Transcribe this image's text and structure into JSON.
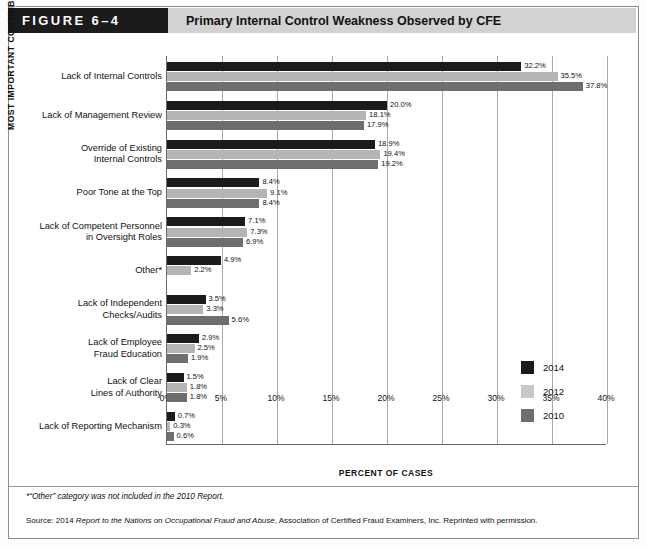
{
  "header": {
    "figure_tag": "FIGURE 6–4",
    "title": "Primary Internal Control Weakness Observed by CFE"
  },
  "axes": {
    "y_axis_title": "MOST IMPORTANT CONTRIBUTING FACTOR",
    "x_axis_title": "PERCENT OF CASES"
  },
  "legend": {
    "items": [
      {
        "label": "2014",
        "color": "#1b1b1b"
      },
      {
        "label": "2012",
        "color": "#c8c8c8"
      },
      {
        "label": "2010",
        "color": "#6e6e6e"
      }
    ]
  },
  "notes": {
    "footnote": "*“Other” category was not included in the 2010 Report.",
    "source_prefix": "Source: 2014 ",
    "source_italic1": "Report to the Nations",
    "source_mid": " on ",
    "source_italic2": "Occupational Fraud and Abuse",
    "source_suffix": ", Association of Certified Fraud Examiners, Inc. Reprinted with permission."
  },
  "chart_data": {
    "type": "bar",
    "orientation": "horizontal",
    "title": "Primary Internal Control Weakness Observed by CFE",
    "xlabel": "PERCENT OF CASES",
    "ylabel": "MOST IMPORTANT CONTRIBUTING FACTOR",
    "xlim": [
      0,
      40
    ],
    "xticks": [
      "0%",
      "5%",
      "10%",
      "15%",
      "20%",
      "25%",
      "30%",
      "35%",
      "40%"
    ],
    "xtick_values": [
      0,
      5,
      10,
      15,
      20,
      25,
      30,
      35,
      40
    ],
    "grid": true,
    "legend_position": "right-inside",
    "categories": [
      "Lack of Internal Controls",
      "Lack of Management Review",
      "Override of Existing\nInternal Controls",
      "Poor Tone at the Top",
      "Lack of Competent Personnel\nin Oversight Roles",
      "Other*",
      "Lack of Independent\nChecks/Audits",
      "Lack of Employee\nFraud Education",
      "Lack of Clear\nLines of Authority",
      "Lack of Reporting Mechanism"
    ],
    "series": [
      {
        "name": "2014",
        "color": "#1b1b1b",
        "values": [
          32.2,
          20.0,
          18.9,
          8.4,
          7.1,
          4.9,
          3.5,
          2.9,
          1.5,
          0.7
        ],
        "labels": [
          "32.2%",
          "20.0%",
          "18.9%",
          "8.4%",
          "7.1%",
          "4.9%",
          "3.5%",
          "2.9%",
          "1.5%",
          "0.7%"
        ]
      },
      {
        "name": "2012",
        "color": "#b5b5b5",
        "values": [
          35.5,
          18.1,
          19.4,
          9.1,
          7.3,
          2.2,
          3.3,
          2.5,
          1.8,
          0.3
        ],
        "labels": [
          "35.5%",
          "18.1%",
          "19.4%",
          "9.1%",
          "7.3%",
          "2.2%",
          "3.3%",
          "2.5%",
          "1.8%",
          "0.3%"
        ]
      },
      {
        "name": "2010",
        "color": "#6e6e6e",
        "values": [
          37.8,
          17.9,
          19.2,
          8.4,
          6.9,
          null,
          5.6,
          1.9,
          1.8,
          0.6
        ],
        "labels": [
          "37.8%",
          "17.9%",
          "19.2%",
          "8.4%",
          "6.9%",
          null,
          "5.6%",
          "1.9%",
          "1.8%",
          "0.6%"
        ]
      }
    ]
  }
}
